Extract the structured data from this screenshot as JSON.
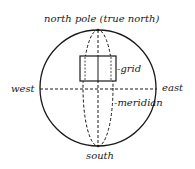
{
  "diagram": {
    "title": "",
    "labels": {
      "north": "north pole (true north)",
      "south": "south",
      "west": "west",
      "east": "east",
      "grid": "-grid",
      "meridian": "-meridian"
    },
    "colors": {
      "stroke": "#1a1a1a",
      "background": "#ffffff"
    },
    "geometry": {
      "globe": {
        "cx": 98,
        "cy": 88,
        "r": 58
      },
      "meridian_ellipse": {
        "cx": 98,
        "cy": 88,
        "rx": 15,
        "ry": 58
      },
      "equator": {
        "x1": 40,
        "x2": 156,
        "y": 89
      },
      "central_meridian": {
        "x": 98,
        "y1": 30,
        "y2": 146
      },
      "grid_rect": {
        "x": 80,
        "y": 56,
        "width": 36,
        "height": 25
      }
    }
  }
}
